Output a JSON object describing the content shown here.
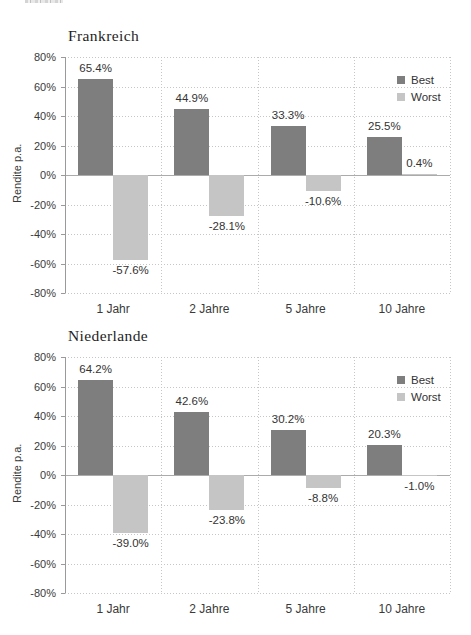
{
  "page": {
    "background": "#ffffff"
  },
  "chart_data": [
    {
      "type": "bar",
      "title": "Frankreich",
      "ylabel": "Rendite p.a.",
      "categories": [
        "1 Jahr",
        "2 Jahre",
        "5 Jahre",
        "10 Jahre"
      ],
      "series": [
        {
          "name": "Best",
          "color": "#7e7e7e",
          "values": [
            65.4,
            44.9,
            33.3,
            25.5
          ],
          "labels": [
            "65.4%",
            "44.9%",
            "33.3%",
            "25.5%"
          ]
        },
        {
          "name": "Worst",
          "color": "#c5c5c5",
          "values": [
            -57.6,
            -28.1,
            -10.6,
            0.4
          ],
          "labels": [
            "-57.6%",
            "-28.1%",
            "-10.6%",
            "0.4%"
          ]
        }
      ],
      "ylim": [
        -80,
        80
      ],
      "ytick_step": 20,
      "ytick_labels": [
        "80%",
        "60%",
        "40%",
        "20%",
        "0%",
        "-20%",
        "-40%",
        "-60%",
        "-80%"
      ],
      "legend_position": "top-right",
      "grid": true
    },
    {
      "type": "bar",
      "title": "Niederlande",
      "ylabel": "Rendite p.a.",
      "categories": [
        "1 Jahr",
        "2 Jahre",
        "5 Jahre",
        "10 Jahre"
      ],
      "series": [
        {
          "name": "Best",
          "color": "#7e7e7e",
          "values": [
            64.2,
            42.6,
            30.2,
            20.3
          ],
          "labels": [
            "64.2%",
            "42.6%",
            "30.2%",
            "20.3%"
          ]
        },
        {
          "name": "Worst",
          "color": "#c5c5c5",
          "values": [
            -39.0,
            -23.8,
            -8.8,
            -1.0
          ],
          "labels": [
            "-39.0%",
            "-23.8%",
            "-8.8%",
            "-1.0%"
          ]
        }
      ],
      "ylim": [
        -80,
        80
      ],
      "ytick_step": 20,
      "ytick_labels": [
        "80%",
        "60%",
        "40%",
        "20%",
        "0%",
        "-20%",
        "-40%",
        "-60%",
        "-80%"
      ],
      "legend_position": "top-right",
      "grid": true
    }
  ]
}
